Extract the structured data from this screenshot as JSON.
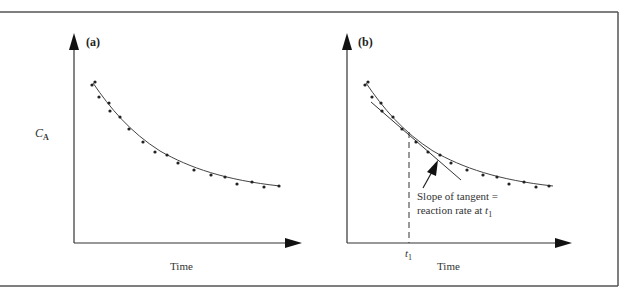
{
  "figure": {
    "panels": [
      {
        "id": "a",
        "label": "(a)",
        "ylabel_main": "C",
        "ylabel_sub": "A",
        "xlabel": "Time"
      },
      {
        "id": "b",
        "label": "(b)",
        "xlabel": "Time",
        "tick_main": "t",
        "tick_sub": "1",
        "annotation_line1": "Slope of tangent =",
        "annotation_line2_main": "reaction rate at t",
        "annotation_line2_sub": "1"
      }
    ],
    "colors": {
      "axis": "#333333",
      "curve": "#444444",
      "points": "#222222",
      "frame": "#555555"
    }
  },
  "chart_data": [
    {
      "type": "scatter",
      "title": "(a)",
      "xlabel": "Time",
      "ylabel": "C_A",
      "description": "Concentration of A decreasing with time; scattered data points with smooth fitted exponential-decay curve",
      "points_px": [
        [
          92,
          84
        ],
        [
          95,
          82
        ],
        [
          99,
          97
        ],
        [
          109,
          103
        ],
        [
          110,
          111
        ],
        [
          120,
          117
        ],
        [
          129,
          129
        ],
        [
          143,
          142
        ],
        [
          155,
          152
        ],
        [
          167,
          155
        ],
        [
          178,
          163
        ],
        [
          194,
          170
        ],
        [
          211,
          175
        ],
        [
          225,
          177
        ],
        [
          237,
          184
        ],
        [
          252,
          182
        ],
        [
          264,
          187
        ],
        [
          279,
          186
        ]
      ],
      "curve": "smooth decay fit through points",
      "grid": false
    },
    {
      "type": "scatter",
      "title": "(b)",
      "xlabel": "Time",
      "ylabel": "C_A",
      "description": "Same data with tangent line drawn at t1; dashed vertical line from curve to t1 on time axis",
      "points_px": [
        [
          365,
          84
        ],
        [
          368,
          82
        ],
        [
          372,
          97
        ],
        [
          381,
          103
        ],
        [
          382,
          111
        ],
        [
          393,
          117
        ],
        [
          402,
          129
        ],
        [
          416,
          142
        ],
        [
          428,
          152
        ],
        [
          440,
          155
        ],
        [
          451,
          163
        ],
        [
          467,
          170
        ],
        [
          483,
          175
        ],
        [
          497,
          177
        ],
        [
          509,
          184
        ],
        [
          524,
          182
        ],
        [
          536,
          187
        ],
        [
          549,
          186
        ]
      ],
      "tangent_at": "t1",
      "annotation": "Slope of tangent = reaction rate at t1",
      "grid": false
    }
  ]
}
